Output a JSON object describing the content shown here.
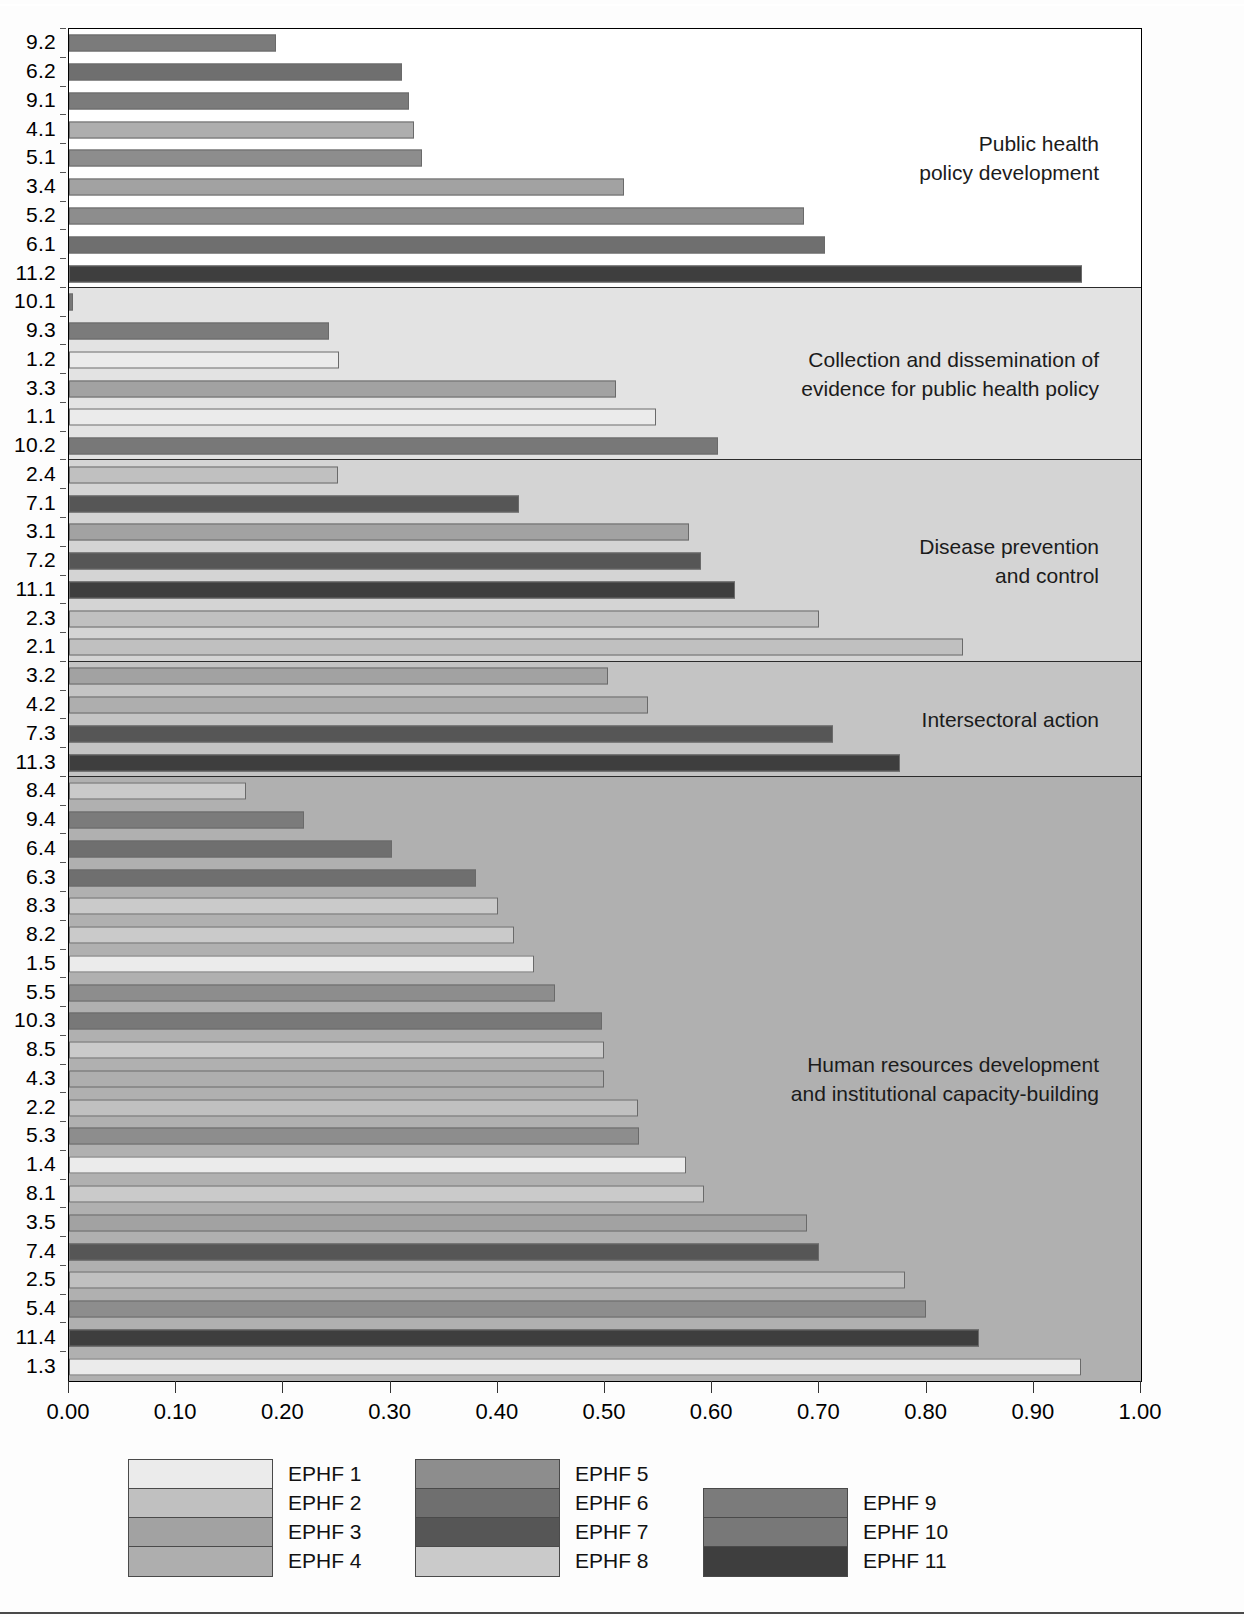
{
  "chart_data": {
    "type": "bar",
    "orientation": "horizontal",
    "title": "",
    "xlabel": "",
    "ylabel": "",
    "xlim": [
      0.0,
      1.0
    ],
    "grid": false,
    "legend_position": "bottom",
    "xticks": [
      "0.00",
      "0.10",
      "0.20",
      "0.30",
      "0.40",
      "0.50",
      "0.60",
      "0.70",
      "0.80",
      "0.90",
      "1.00"
    ],
    "xtick_values": [
      0.0,
      0.1,
      0.2,
      0.3,
      0.4,
      0.5,
      0.6,
      0.7,
      0.8,
      0.9,
      1.0
    ],
    "groups": [
      {
        "label": "Public health\npolicy development",
        "background": "#ffffff",
        "bars": [
          {
            "category": "9.2",
            "value": 0.193,
            "series": "EPHF 9"
          },
          {
            "category": "6.2",
            "value": 0.311,
            "series": "EPHF 6"
          },
          {
            "category": "9.1",
            "value": 0.317,
            "series": "EPHF 9"
          },
          {
            "category": "4.1",
            "value": 0.322,
            "series": "EPHF 4"
          },
          {
            "category": "5.1",
            "value": 0.329,
            "series": "EPHF 5"
          },
          {
            "category": "3.4",
            "value": 0.518,
            "series": "EPHF 3"
          },
          {
            "category": "5.2",
            "value": 0.686,
            "series": "EPHF 5"
          },
          {
            "category": "6.1",
            "value": 0.705,
            "series": "EPHF 6"
          },
          {
            "category": "11.2",
            "value": 0.945,
            "series": "EPHF 11"
          }
        ]
      },
      {
        "label": "Collection and dissemination of\nevidence for public health policy",
        "background": "#e3e3e3",
        "bars": [
          {
            "category": "10.1",
            "value": 0.004,
            "series": "EPHF 10"
          },
          {
            "category": "9.3",
            "value": 0.243,
            "series": "EPHF 9"
          },
          {
            "category": "1.2",
            "value": 0.252,
            "series": "EPHF 1"
          },
          {
            "category": "3.3",
            "value": 0.51,
            "series": "EPHF 3"
          },
          {
            "category": "1.1",
            "value": 0.548,
            "series": "EPHF 1"
          },
          {
            "category": "10.2",
            "value": 0.605,
            "series": "EPHF 10"
          }
        ]
      },
      {
        "label": "Disease prevention\nand control",
        "background": "#d4d4d4",
        "bars": [
          {
            "category": "2.4",
            "value": 0.251,
            "series": "EPHF 2"
          },
          {
            "category": "7.1",
            "value": 0.42,
            "series": "EPHF 7"
          },
          {
            "category": "3.1",
            "value": 0.578,
            "series": "EPHF 3"
          },
          {
            "category": "7.2",
            "value": 0.59,
            "series": "EPHF 7"
          },
          {
            "category": "11.1",
            "value": 0.621,
            "series": "EPHF 11"
          },
          {
            "category": "2.3",
            "value": 0.7,
            "series": "EPHF 2"
          },
          {
            "category": "2.1",
            "value": 0.834,
            "series": "EPHF 2"
          }
        ]
      },
      {
        "label": "Intersectoral action",
        "background": "#c4c4c4",
        "bars": [
          {
            "category": "3.2",
            "value": 0.503,
            "series": "EPHF 3"
          },
          {
            "category": "4.2",
            "value": 0.54,
            "series": "EPHF 4"
          },
          {
            "category": "7.3",
            "value": 0.713,
            "series": "EPHF 7"
          },
          {
            "category": "11.3",
            "value": 0.775,
            "series": "EPHF 11"
          }
        ]
      },
      {
        "label": "Human resources development\nand institutional capacity-building",
        "background": "#b0b0b0",
        "bars": [
          {
            "category": "8.4",
            "value": 0.165,
            "series": "EPHF 8"
          },
          {
            "category": "9.4",
            "value": 0.219,
            "series": "EPHF 9"
          },
          {
            "category": "6.4",
            "value": 0.301,
            "series": "EPHF 6"
          },
          {
            "category": "6.3",
            "value": 0.38,
            "series": "EPHF 6"
          },
          {
            "category": "8.3",
            "value": 0.4,
            "series": "EPHF 8"
          },
          {
            "category": "8.2",
            "value": 0.415,
            "series": "EPHF 8"
          },
          {
            "category": "1.5",
            "value": 0.434,
            "series": "EPHF 1"
          },
          {
            "category": "5.5",
            "value": 0.453,
            "series": "EPHF 5"
          },
          {
            "category": "10.3",
            "value": 0.497,
            "series": "EPHF 10"
          },
          {
            "category": "8.5",
            "value": 0.499,
            "series": "EPHF 8"
          },
          {
            "category": "4.3",
            "value": 0.499,
            "series": "EPHF 4"
          },
          {
            "category": "2.2",
            "value": 0.531,
            "series": "EPHF 2"
          },
          {
            "category": "5.3",
            "value": 0.532,
            "series": "EPHF 5"
          },
          {
            "category": "1.4",
            "value": 0.576,
            "series": "EPHF 1"
          },
          {
            "category": "8.1",
            "value": 0.592,
            "series": "EPHF 8"
          },
          {
            "category": "3.5",
            "value": 0.688,
            "series": "EPHF 3"
          },
          {
            "category": "7.4",
            "value": 0.7,
            "series": "EPHF 7"
          },
          {
            "category": "2.5",
            "value": 0.78,
            "series": "EPHF 2"
          },
          {
            "category": "5.4",
            "value": 0.799,
            "series": "EPHF 5"
          },
          {
            "category": "11.4",
            "value": 0.849,
            "series": "EPHF 11"
          },
          {
            "category": "1.3",
            "value": 0.944,
            "series": "EPHF 1"
          }
        ]
      }
    ],
    "series_colors": {
      "EPHF 1": "#ebebeb",
      "EPHF 2": "#c0c0c0",
      "EPHF 3": "#a2a2a2",
      "EPHF 4": "#aeaeae",
      "EPHF 5": "#8d8d8d",
      "EPHF 6": "#6f6f6f",
      "EPHF 7": "#565656",
      "EPHF 8": "#cacaca",
      "EPHF 9": "#7b7b7b",
      "EPHF 10": "#787878",
      "EPHF 11": "#3e3e3e"
    }
  },
  "legend": {
    "columns": [
      {
        "entries": [
          {
            "label": "EPHF 1",
            "color": "#ebebeb"
          },
          {
            "label": "EPHF 2",
            "color": "#c0c0c0"
          },
          {
            "label": "EPHF 3",
            "color": "#a2a2a2"
          },
          {
            "label": "EPHF 4",
            "color": "#aeaeae"
          }
        ]
      },
      {
        "entries": [
          {
            "label": "EPHF 5",
            "color": "#8d8d8d"
          },
          {
            "label": "EPHF 6",
            "color": "#6f6f6f"
          },
          {
            "label": "EPHF 7",
            "color": "#565656"
          },
          {
            "label": "EPHF 8",
            "color": "#cacaca"
          }
        ]
      },
      {
        "entries": [
          {
            "label": "EPHF 9",
            "color": "#7b7b7b"
          },
          {
            "label": "EPHF 10",
            "color": "#787878"
          },
          {
            "label": "EPHF 11",
            "color": "#3e3e3e"
          }
        ]
      }
    ]
  }
}
